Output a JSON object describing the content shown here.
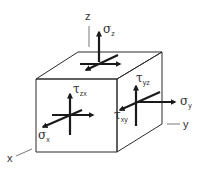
{
  "diagram": {
    "axes": {
      "x": "x",
      "y": "y",
      "z": "z"
    },
    "labels": {
      "sigma_z": {
        "symbol": "σ",
        "sub": "z"
      },
      "sigma_x": {
        "symbol": "σ",
        "sub": "x"
      },
      "sigma_y": {
        "symbol": "σ",
        "sub": "y"
      },
      "tau_zx": {
        "symbol": "τ",
        "sub": "zx"
      },
      "tau_yz": {
        "symbol": "τ",
        "sub": "yz"
      },
      "tau_xy": {
        "symbol": "τ",
        "sub": "xy"
      }
    },
    "colors": {
      "line": "#2a2a2a",
      "arrow": "#1a1a1a",
      "background": "#ffffff"
    }
  }
}
